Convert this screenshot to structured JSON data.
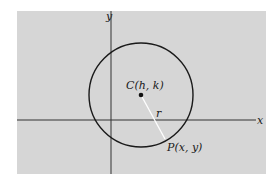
{
  "diagram": {
    "background_color": "#d6d6d6",
    "axis_labels": {
      "x": "x",
      "y": "y"
    },
    "center_label": "C(h, k)",
    "radius_label": "r",
    "point_label": "P(x, y)",
    "colors": {
      "stroke": "#1a1a1a",
      "radius_line": "#ffffff"
    }
  }
}
